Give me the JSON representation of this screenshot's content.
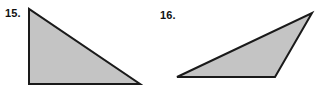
{
  "figure": {
    "background_color": "#ffffff",
    "shape_fill_color": "#c4c4c4",
    "shape_stroke_color": "#1a1a1a",
    "label_color": "#111111",
    "stroke_width": 2
  },
  "problems": [
    {
      "number": "15.",
      "label_name": "problem-number-15",
      "shape_name": "right-triangle",
      "shape_description": "right triangle",
      "points": "29,9 29,84 140,84",
      "vertices": [
        {
          "x": 29,
          "y": 9
        },
        {
          "x": 29,
          "y": 84
        },
        {
          "x": 140,
          "y": 84
        }
      ]
    },
    {
      "number": "16.",
      "label_name": "problem-number-16",
      "shape_name": "obtuse-scalene-triangle",
      "shape_description": "obtuse scalene triangle",
      "points": "312,13 275,77 177,77",
      "vertices": [
        {
          "x": 312,
          "y": 13
        },
        {
          "x": 275,
          "y": 77
        },
        {
          "x": 177,
          "y": 77
        }
      ]
    }
  ],
  "chart_data": {
    "type": "diagram",
    "title": "",
    "items": [
      {
        "label": "15.",
        "shape": "right triangle",
        "vertices": [
          [
            29,
            9
          ],
          [
            29,
            84
          ],
          [
            140,
            84
          ]
        ]
      },
      {
        "label": "16.",
        "shape": "obtuse scalene triangle",
        "vertices": [
          [
            312,
            13
          ],
          [
            275,
            77
          ],
          [
            177,
            77
          ]
        ]
      }
    ]
  }
}
